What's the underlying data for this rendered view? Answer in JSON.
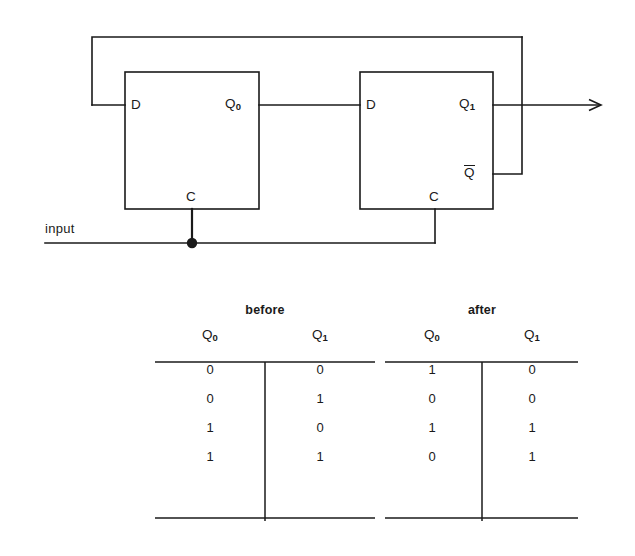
{
  "figure": {
    "type": "logic-circuit-with-truth-tables"
  },
  "circuit": {
    "input_label": "input",
    "flipflops": [
      {
        "id": "ff0",
        "d_label": "D",
        "c_label": "C",
        "q_label": "Q",
        "q_subscript": "0",
        "has_qbar": false,
        "qbar_label": ""
      },
      {
        "id": "ff1",
        "d_label": "D",
        "c_label": "C",
        "q_label": "Q",
        "q_subscript": "1",
        "has_qbar": true,
        "qbar_label": "Q"
      }
    ],
    "wires": {
      "feedback_from": "Q-bar of second flip-flop",
      "feedback_to": "D of first flip-flop",
      "clock_shared": true,
      "output_arrow": true
    },
    "colors": {
      "line": "#1a1a1a",
      "background": "#ffffff",
      "junction_dot": "#1a1a1a"
    }
  },
  "tables": [
    {
      "id": "before",
      "caption": "before",
      "columns": [
        {
          "label": "Q",
          "subscript": "0"
        },
        {
          "label": "Q",
          "subscript": "1"
        }
      ],
      "rows": [
        [
          "0",
          "0"
        ],
        [
          "0",
          "1"
        ],
        [
          "1",
          "0"
        ],
        [
          "1",
          "1"
        ]
      ]
    },
    {
      "id": "after",
      "caption": "after",
      "columns": [
        {
          "label": "Q",
          "subscript": "0"
        },
        {
          "label": "Q",
          "subscript": "1"
        }
      ],
      "rows": [
        [
          "1",
          "0"
        ],
        [
          "0",
          "0"
        ],
        [
          "1",
          "1"
        ],
        [
          "0",
          "1"
        ]
      ]
    }
  ]
}
